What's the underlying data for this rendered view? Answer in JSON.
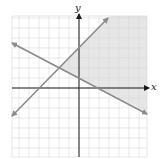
{
  "chart_data": {
    "type": "line",
    "title": "",
    "xlabel": "x",
    "ylabel": "y",
    "xlim": [
      -6.7,
      6.8
    ],
    "ylim": [
      -6.9,
      7.2
    ],
    "grid": true,
    "grid_step": 1,
    "tick_labels": false,
    "legend": null,
    "series": [
      {
        "name": "line-increasing",
        "equation": "y = x + 4",
        "slope": 1,
        "intercept": 4,
        "x": [
          -6.7,
          2.9
        ],
        "y": [
          -2.8,
          7.0
        ],
        "arrows": "both",
        "color": "#8a8a8a"
      },
      {
        "name": "line-decreasing",
        "equation": "y = -0.5x + 1",
        "slope": -0.5,
        "intercept": 1,
        "x": [
          -6.7,
          6.8
        ],
        "y": [
          4.5,
          -2.6
        ],
        "arrows": "both",
        "color": "#8a8a8a"
      }
    ],
    "intersection": [
      -2,
      2
    ],
    "shaded_region": {
      "description": "solution region of the system",
      "inequalities": [
        "y <= x + 4",
        "y >= -0.5x + 1"
      ],
      "color": "#e6e6e6"
    }
  },
  "labels": {
    "x_axis": "x",
    "y_axis": "y"
  },
  "colors": {
    "background": "#ffffff",
    "grid": "#d8d8d8",
    "axis": "#1a1a1a",
    "line": "#8a8a8a",
    "shade": "#e6e6e6"
  },
  "layout": {
    "origin_px": [
      79,
      88
    ],
    "unit_px": 10
  }
}
